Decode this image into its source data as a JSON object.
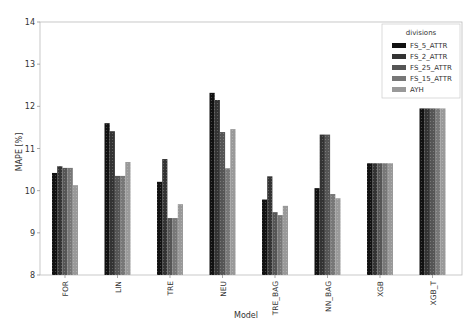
{
  "chart_data": {
    "type": "bar",
    "title": "",
    "xlabel": "Model",
    "ylabel": "MAPE [%]",
    "ylim": [
      8,
      14
    ],
    "yticks": [
      8,
      9,
      10,
      11,
      12,
      13,
      14
    ],
    "grid": false,
    "legend_position": "upper right",
    "legend_title": "divisions",
    "categories": [
      "FOR",
      "LIN",
      "TRE",
      "NEU",
      "TRE_BAG",
      "NN_BAG",
      "XGB",
      "XGB_T"
    ],
    "series": [
      {
        "name": "FS_5_ATTR",
        "color": "#111111",
        "values": [
          10.42,
          11.6,
          10.21,
          12.32,
          9.79,
          10.06,
          10.65,
          11.95
        ]
      },
      {
        "name": "FS_2_ATTR",
        "color": "#333333",
        "values": [
          10.58,
          11.41,
          10.75,
          12.15,
          10.34,
          11.33,
          10.65,
          11.95
        ]
      },
      {
        "name": "FS_25_ATTR",
        "color": "#555555",
        "values": [
          10.54,
          10.35,
          9.35,
          11.39,
          9.49,
          11.33,
          10.65,
          11.95
        ]
      },
      {
        "name": "FS_15_ATTR",
        "color": "#777777",
        "values": [
          10.54,
          10.35,
          9.35,
          10.53,
          9.42,
          9.92,
          10.65,
          11.95
        ]
      },
      {
        "name": "AYH",
        "color": "#999999",
        "values": [
          10.13,
          10.68,
          9.68,
          11.46,
          9.64,
          9.82,
          10.65,
          11.95
        ]
      }
    ]
  }
}
